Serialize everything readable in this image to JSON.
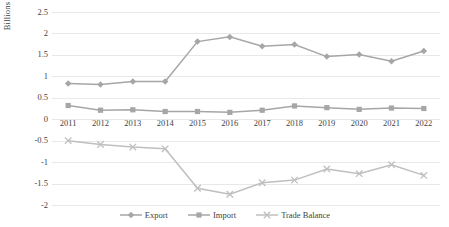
{
  "chart_data": {
    "type": "line",
    "title": "",
    "xlabel": "",
    "ylabel": "Billions",
    "categories": [
      "2011",
      "2012",
      "2013",
      "2014",
      "2015",
      "2016",
      "2017",
      "2018",
      "2019",
      "2020",
      "2021",
      "2022"
    ],
    "ylim": [
      -2,
      2.5
    ],
    "ytick_labels": [
      "2.5",
      "2",
      "1.5",
      "1",
      "0.5",
      "0",
      "-0.5",
      "-1",
      "-1.5",
      "-2"
    ],
    "ytick_values": [
      2.5,
      2,
      1.5,
      1,
      0.5,
      0,
      -0.5,
      -1,
      -1.5,
      -2
    ],
    "grid": true,
    "legend_position": "bottom",
    "series": [
      {
        "name": "Export",
        "marker": "diamond",
        "color": "#a6a6a6",
        "values": [
          0.83,
          0.81,
          0.88,
          0.88,
          1.81,
          1.92,
          1.7,
          1.74,
          1.46,
          1.51,
          1.35,
          1.59
        ]
      },
      {
        "name": "Import",
        "marker": "square",
        "color": "#a6a6a6",
        "values": [
          0.32,
          0.21,
          0.22,
          0.18,
          0.18,
          0.16,
          0.21,
          0.31,
          0.27,
          0.23,
          0.26,
          0.25
        ]
      },
      {
        "name": "Trade Balance",
        "marker": "x",
        "color": "#bfbfbf",
        "values": [
          -0.5,
          -0.59,
          -0.65,
          -0.69,
          -1.61,
          -1.75,
          -1.48,
          -1.42,
          -1.16,
          -1.27,
          -1.06,
          -1.31
        ]
      }
    ]
  },
  "colors": {
    "gridline": "#e8e8e8",
    "text": "#3f3f3f",
    "series_primary": "#a6a6a6",
    "series_secondary": "#bfbfbf",
    "background": "#ffffff"
  }
}
